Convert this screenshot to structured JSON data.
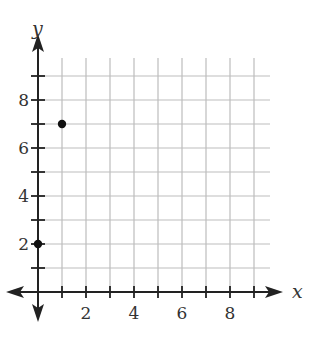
{
  "chart_data": {
    "type": "scatter",
    "title": "",
    "xlabel": "x",
    "ylabel": "y",
    "xlim": [
      0,
      9
    ],
    "ylim": [
      0,
      9
    ],
    "grid": true,
    "x_ticks": [
      2,
      4,
      6,
      8
    ],
    "y_ticks": [
      2,
      4,
      6,
      8
    ],
    "points": [
      {
        "x": 0,
        "y": 2
      },
      {
        "x": 1,
        "y": 7
      }
    ]
  },
  "colors": {
    "axis": "#222222",
    "grid": "#bdbdbd",
    "point": "#111111",
    "text": "#333333"
  }
}
